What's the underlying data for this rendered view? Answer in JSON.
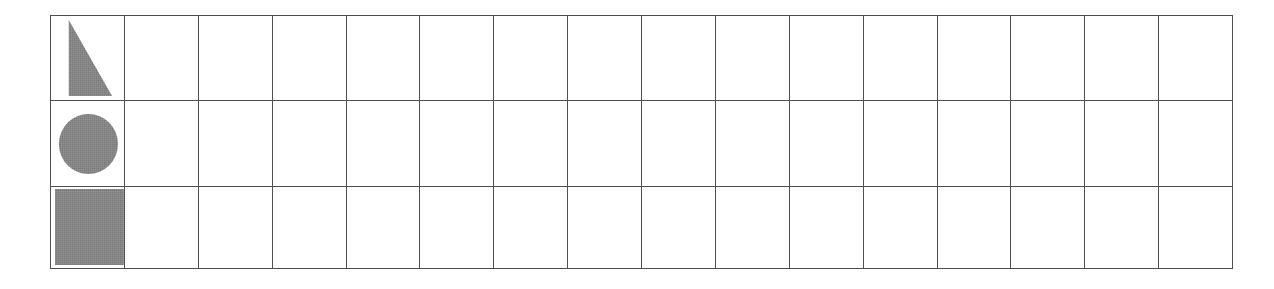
{
  "page": {
    "background_color": "#ffffff"
  },
  "grid": {
    "columns": 16,
    "rows": 3,
    "left_px": 50,
    "top_px": 15,
    "width_px": 1183,
    "height_px": 250,
    "column_width_px": 74,
    "row_heights_px": [
      84,
      85,
      81
    ],
    "line_color": "#4f4f4f",
    "line_width_px": 1,
    "cell_fill_color": "#ffffff"
  },
  "ink": {
    "fill_color": "#7a7a7a",
    "texture": "dithered-halftone"
  },
  "shapes": [
    {
      "id": "triangle",
      "name": "right-triangle",
      "row": 1,
      "column": 1,
      "label": "",
      "description": "filled right triangle, vertical edge on the left, apex at top-left, hypotenuse descending to lower-right",
      "points": "18,4 18,80 62,80",
      "fill_color": "#7a7a7a"
    },
    {
      "id": "circle",
      "name": "circle",
      "row": 2,
      "column": 1,
      "label": "",
      "description": "filled circle centered in the cell",
      "cx": 38,
      "cy": 43,
      "r": 30,
      "fill_color": "#7a7a7a"
    },
    {
      "id": "square",
      "name": "square",
      "row": 3,
      "column": 1,
      "label": "",
      "description": "filled square nearly filling the cell",
      "x": 4,
      "y": 2,
      "width": 70,
      "height": 76,
      "fill_color": "#7a7a7a"
    }
  ],
  "empty_cells": {
    "count": 45,
    "label": ""
  }
}
